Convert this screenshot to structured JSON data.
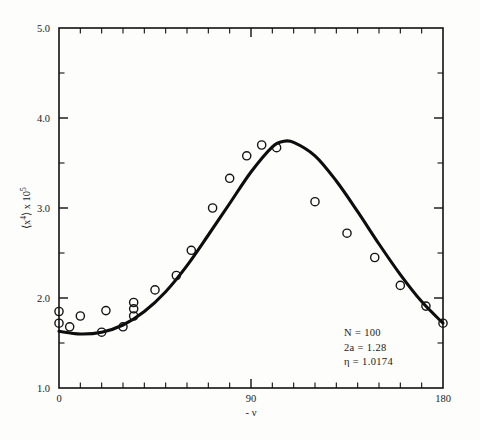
{
  "chart_data": {
    "type": "scatter",
    "title": "",
    "xlabel": "- ν",
    "ylabel": "⟨x⁴⟩ x 10⁵",
    "ylabel_parts": {
      "base": "⟨x",
      "exponent": "4",
      "mid": "⟩ x 10",
      "power": "5"
    },
    "xlim": [
      0,
      180
    ],
    "ylim": [
      1.0,
      5.0
    ],
    "x_tick_labels": [
      "0",
      "90",
      "180"
    ],
    "x_tick_values": [
      0,
      90,
      180
    ],
    "x_minor_interval": 10,
    "y_tick_labels": [
      "1.0",
      "2.0",
      "3.0",
      "4.0",
      "5.0"
    ],
    "y_tick_values": [
      1.0,
      2.0,
      3.0,
      4.0,
      5.0
    ],
    "y_minor_values": [
      1.5,
      2.5,
      3.5,
      4.5
    ],
    "grid": false,
    "legend": "none",
    "marker": "open-circle",
    "curve_color": "#0d0d0d",
    "marker_color": "#141414",
    "series": [
      {
        "name": "measured",
        "kind": "scatter",
        "x": [
          0,
          0,
          5,
          10,
          20,
          22,
          30,
          35,
          35,
          35,
          45,
          55,
          62,
          72,
          80,
          88,
          95,
          102,
          120,
          135,
          148,
          160,
          172,
          180
        ],
        "y": [
          1.85,
          1.72,
          1.68,
          1.8,
          1.62,
          1.86,
          1.68,
          1.95,
          1.88,
          1.8,
          2.09,
          2.25,
          2.53,
          3.0,
          3.33,
          3.58,
          3.7,
          3.67,
          3.07,
          2.72,
          2.45,
          2.14,
          1.91,
          1.72
        ]
      },
      {
        "name": "theoretical fit",
        "kind": "line",
        "x": [
          0,
          10,
          20,
          30,
          40,
          50,
          60,
          70,
          80,
          90,
          100,
          105,
          110,
          120,
          130,
          140,
          150,
          160,
          170,
          180
        ],
        "y": [
          1.63,
          1.6,
          1.62,
          1.7,
          1.85,
          2.07,
          2.36,
          2.7,
          3.05,
          3.4,
          3.68,
          3.74,
          3.73,
          3.58,
          3.3,
          2.96,
          2.6,
          2.26,
          1.96,
          1.72
        ]
      }
    ],
    "annotations": [
      {
        "label": "N = 100"
      },
      {
        "label": "2a = 1.28"
      },
      {
        "label": "η = 1.0174"
      }
    ]
  },
  "figure": {
    "background": "#fdfdfb"
  }
}
